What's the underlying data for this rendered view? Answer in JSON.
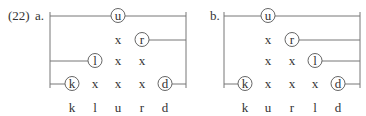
{
  "example_number": "(22)",
  "colors": {
    "line": "#777777",
    "text": "#333333",
    "circle": "#555555"
  },
  "rows_y": [
    16,
    40,
    61,
    84
  ],
  "labels_y": 108,
  "panels": [
    {
      "label": "a.",
      "label_x": 35,
      "left_x": 50,
      "right_x": 186,
      "top_y": 12,
      "bottom_y": 88,
      "columns": [
        {
          "name": "k",
          "x": 72
        },
        {
          "name": "l",
          "x": 95
        },
        {
          "name": "u",
          "x": 118
        },
        {
          "name": "r",
          "x": 142
        },
        {
          "name": "d",
          "x": 165
        }
      ],
      "column_labels": [
        "k",
        "l",
        "u",
        "r",
        "d"
      ],
      "rows": [
        {
          "cells": [
            "",
            "",
            "(u)",
            "",
            ""
          ],
          "line_from": "left",
          "line_to": "right"
        },
        {
          "cells": [
            "",
            "",
            "x",
            "(r)",
            ""
          ],
          "line_from": null,
          "line_to": "right"
        },
        {
          "cells": [
            "",
            "(l)",
            "x",
            "x",
            ""
          ],
          "line_from": "left",
          "line_to": null
        },
        {
          "cells": [
            "(k)",
            "x",
            "x",
            "x",
            "(d)"
          ],
          "line_from": "left",
          "line_to": "right"
        }
      ]
    },
    {
      "label": "b.",
      "label_x": 210,
      "left_x": 224,
      "right_x": 360,
      "top_y": 12,
      "bottom_y": 88,
      "columns": [
        {
          "name": "k",
          "x": 245
        },
        {
          "name": "u",
          "x": 268
        },
        {
          "name": "r",
          "x": 292
        },
        {
          "name": "l",
          "x": 315
        },
        {
          "name": "d",
          "x": 338
        }
      ],
      "column_labels": [
        "k",
        "u",
        "r",
        "l",
        "d"
      ],
      "rows": [
        {
          "cells": [
            "",
            "(u)",
            "",
            "",
            ""
          ],
          "line_from": "left",
          "line_to": "right"
        },
        {
          "cells": [
            "",
            "x",
            "(r)",
            "",
            ""
          ],
          "line_from": null,
          "line_to": "right"
        },
        {
          "cells": [
            "",
            "x",
            "x",
            "(l)",
            ""
          ],
          "line_from": null,
          "line_to": "right"
        },
        {
          "cells": [
            "(k)",
            "x",
            "x",
            "x",
            "(d)"
          ],
          "line_from": "left",
          "line_to": "right"
        }
      ]
    }
  ]
}
